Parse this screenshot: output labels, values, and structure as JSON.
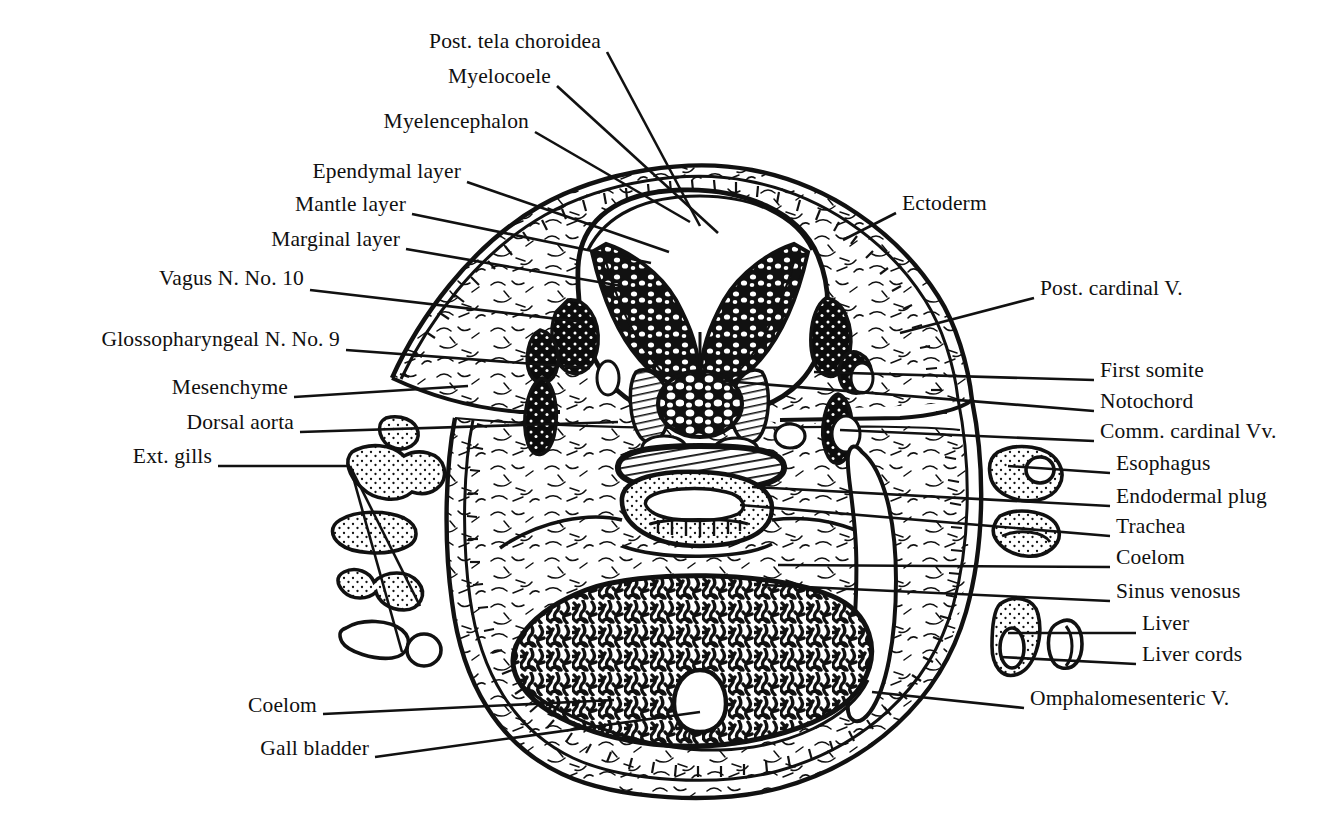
{
  "figure": {
    "ink_color": "#000000",
    "background_color": "#ffffff"
  },
  "labels_left": [
    {
      "id": "post-tela-choroidea",
      "text": "Post. tela choroidea",
      "x": 601,
      "y": 46,
      "lx1": 607,
      "ly1": 52,
      "lx2": 700,
      "ly2": 226
    },
    {
      "id": "myelocoele",
      "text": "Myelocoele",
      "x": 551,
      "y": 81,
      "lx1": 557,
      "ly1": 86,
      "lx2": 718,
      "ly2": 233
    },
    {
      "id": "myelencephalon",
      "text": "Myelencephalon",
      "x": 529,
      "y": 126,
      "lx1": 535,
      "ly1": 132,
      "lx2": 690,
      "ly2": 222
    },
    {
      "id": "ependymal-layer",
      "text": "Ependymal layer",
      "x": 461,
      "y": 176,
      "lx1": 467,
      "ly1": 182,
      "lx2": 669,
      "ly2": 252
    },
    {
      "id": "mantle-layer",
      "text": "Mantle layer",
      "x": 406,
      "y": 209,
      "lx1": 412,
      "ly1": 214,
      "lx2": 651,
      "ly2": 263
    },
    {
      "id": "marginal-layer",
      "text": "Marginal layer",
      "x": 400,
      "y": 244,
      "lx1": 406,
      "ly1": 249,
      "lx2": 622,
      "ly2": 286
    },
    {
      "id": "vagus-n-no-10",
      "text": "Vagus N. No. 10",
      "x": 304,
      "y": 283,
      "lx1": 310,
      "ly1": 290,
      "lx2": 584,
      "ly2": 322
    },
    {
      "id": "glossopharyngeal-n-no-9",
      "text": "Glossopharyngeal N. No. 9",
      "x": 340,
      "y": 344,
      "lx1": 346,
      "ly1": 350,
      "lx2": 590,
      "ly2": 368
    },
    {
      "id": "mesenchyme",
      "text": "Mesenchyme",
      "x": 288,
      "y": 392,
      "lx1": 294,
      "ly1": 397,
      "lx2": 468,
      "ly2": 386
    },
    {
      "id": "dorsal-aorta",
      "text": "Dorsal aorta",
      "x": 294,
      "y": 427,
      "lx1": 300,
      "ly1": 432,
      "lx2": 618,
      "ly2": 422
    },
    {
      "id": "ext-gills",
      "text": "Ext. gills",
      "x": 212,
      "y": 461,
      "lx1": 218,
      "ly1": 466,
      "lx2": 350,
      "ly2": 466
    },
    {
      "id": "coelom-left",
      "text": "Coelom",
      "x": 317,
      "y": 710,
      "lx1": 323,
      "ly1": 714,
      "lx2": 614,
      "ly2": 700
    },
    {
      "id": "gall-bladder",
      "text": "Gall bladder",
      "x": 369,
      "y": 753,
      "lx1": 375,
      "ly1": 757,
      "lx2": 700,
      "ly2": 712
    }
  ],
  "labels_right": [
    {
      "id": "ectoderm",
      "text": "Ectoderm",
      "x": 902,
      "y": 208,
      "lx1": 896,
      "ly1": 213,
      "lx2": 843,
      "ly2": 240
    },
    {
      "id": "post-cardinal-v",
      "text": "Post. cardinal V.",
      "x": 1040,
      "y": 293,
      "lx1": 1034,
      "ly1": 298,
      "lx2": 900,
      "ly2": 333
    },
    {
      "id": "first-somite",
      "text": "First somite",
      "x": 1100,
      "y": 375,
      "lx1": 1094,
      "ly1": 380,
      "lx2": 814,
      "ly2": 372
    },
    {
      "id": "notochord",
      "text": "Notochord",
      "x": 1100,
      "y": 406,
      "lx1": 1094,
      "ly1": 411,
      "lx2": 724,
      "ly2": 381
    },
    {
      "id": "comm-cardinal-vv",
      "text": "Comm. cardinal Vv.",
      "x": 1100,
      "y": 436,
      "lx1": 1094,
      "ly1": 441,
      "lx2": 840,
      "ly2": 430
    },
    {
      "id": "esophagus",
      "text": "Esophagus",
      "x": 1116,
      "y": 468,
      "lx1": 1110,
      "ly1": 473,
      "lx2": 1008,
      "ly2": 466
    },
    {
      "id": "endodermal-plug",
      "text": "Endodermal plug",
      "x": 1116,
      "y": 501,
      "lx1": 1110,
      "ly1": 506,
      "lx2": 752,
      "ly2": 487
    },
    {
      "id": "trachea",
      "text": "Trachea",
      "x": 1116,
      "y": 531,
      "lx1": 1110,
      "ly1": 536,
      "lx2": 740,
      "ly2": 505
    },
    {
      "id": "coelom-right",
      "text": "Coelom",
      "x": 1116,
      "y": 562,
      "lx1": 1110,
      "ly1": 567,
      "lx2": 778,
      "ly2": 565
    },
    {
      "id": "sinus-venosus",
      "text": "Sinus venosus",
      "x": 1116,
      "y": 596,
      "lx1": 1110,
      "ly1": 601,
      "lx2": 762,
      "ly2": 585
    },
    {
      "id": "liver",
      "text": "Liver",
      "x": 1142,
      "y": 628,
      "lx1": 1136,
      "ly1": 633,
      "lx2": 1008,
      "ly2": 633
    },
    {
      "id": "liver-cords",
      "text": "Liver cords",
      "x": 1142,
      "y": 659,
      "lx1": 1136,
      "ly1": 664,
      "lx2": 1000,
      "ly2": 657
    },
    {
      "id": "omphalomesenteric-v",
      "text": "Omphalomesenteric V.",
      "x": 1030,
      "y": 703,
      "lx1": 1024,
      "ly1": 708,
      "lx2": 872,
      "ly2": 692
    }
  ],
  "ext_gills_fan": [
    {
      "from_x": 350,
      "from_y": 466,
      "to_x": 420,
      "to_y": 606
    },
    {
      "from_x": 350,
      "from_y": 466,
      "to_x": 402,
      "to_y": 652
    }
  ],
  "structures": [
    {
      "id": "ectoderm-band",
      "name": "Ectoderm",
      "pattern": "ladder-hatch"
    },
    {
      "id": "myelencephalon-wall",
      "name": "Myelencephalon",
      "pattern": "stipple-cell"
    },
    {
      "id": "myelocoele-cavity",
      "name": "Myelocoele",
      "pattern": "open"
    },
    {
      "id": "notochord-body",
      "name": "Notochord",
      "pattern": "vacuolated-cells"
    },
    {
      "id": "somite-pair",
      "name": "First somite",
      "pattern": "line-hatch"
    },
    {
      "id": "dorsal-aorta-lumen",
      "name": "Dorsal aorta",
      "pattern": "heavy-hatch"
    },
    {
      "id": "ganglion-masses",
      "name": "Vagus / Glossopharyngeal ganglia",
      "pattern": "dense-stipple"
    },
    {
      "id": "liver-cord-mass",
      "name": "Liver cords",
      "pattern": "labyrinth"
    },
    {
      "id": "gall-bladder-lumen",
      "name": "Gall bladder",
      "pattern": "open-oval"
    },
    {
      "id": "mesenchyme-field",
      "name": "Mesenchyme",
      "pattern": "sparse-squiggle"
    },
    {
      "id": "ext-gill-blobs",
      "name": "Ext. gills",
      "pattern": "stippled-outline"
    }
  ]
}
